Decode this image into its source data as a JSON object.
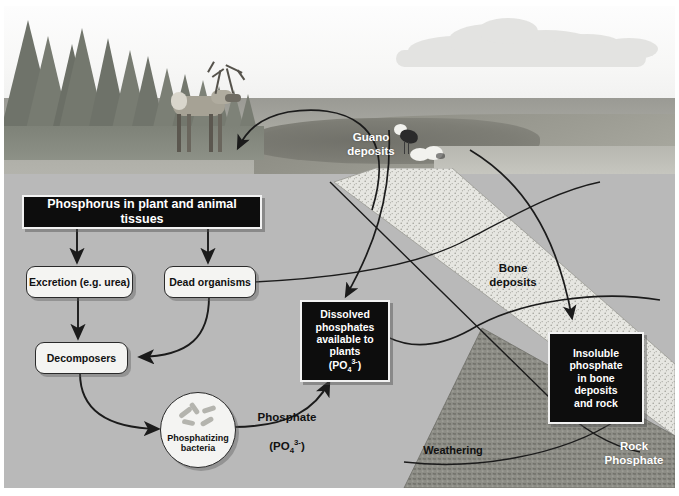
{
  "diagram": {
    "background_color": "#b9b9b9",
    "boxes": {
      "phosphorus_tissues": "Phosphorus in plant and animal tissues",
      "excretion": "Excretion (e.g. urea)",
      "dead_organisms": "Dead organisms",
      "decomposers": "Decomposers",
      "phosphatizing_bacteria": "Phosphatizing\nbacteria",
      "dissolved_phosphates_l1": "Dissolved",
      "dissolved_phosphates_l2": "phosphates",
      "dissolved_phosphates_l3": "available to",
      "dissolved_phosphates_l4": "plants",
      "dissolved_phosphates_formula_pre": "(PO",
      "dissolved_phosphates_formula_sub": "4",
      "dissolved_phosphates_formula_sup": "3-",
      "dissolved_phosphates_formula_post": ")",
      "insoluble_l1": "Insoluble",
      "insoluble_l2": "phosphate",
      "insoluble_l3": "in bone",
      "insoluble_l4": "deposits",
      "insoluble_l5": "and rock"
    },
    "labels": {
      "guano_deposits": "Guano\ndeposits",
      "bone_deposits": "Bone\ndeposits",
      "rock_phosphate": "Rock\nPhosphate",
      "weathering": "Weathering",
      "phosphate_word": "Phosphate",
      "phosphate_formula_pre": "(PO",
      "phosphate_formula_sub": "4",
      "phosphate_formula_sup": "3-",
      "phosphate_formula_post": ")"
    },
    "colors": {
      "panel": "#b9b9b9",
      "dark_box": "#0d0d0d",
      "light_box": "#f4f4f2",
      "rock_band": "#8d8d86",
      "bone_band": "#e2e2dd",
      "arrow": "#1b1b1b"
    },
    "photo": {
      "scene": "boreal-forest-tundra-with-caribou-and-seabirds",
      "elements": [
        "conifer-forest",
        "caribou",
        "cloud",
        "sky",
        "pond",
        "seagull",
        "gull-pair"
      ]
    }
  }
}
